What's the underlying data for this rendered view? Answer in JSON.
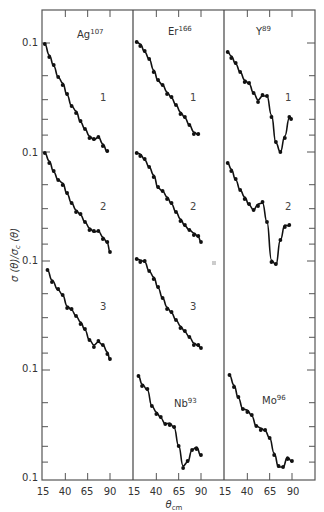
{
  "chart_data": {
    "type": "line",
    "title": "",
    "xlabel": "θ_cm",
    "ylabel": "σ (θ)/σ_c (θ)",
    "x_ticks": [
      15,
      40,
      65,
      90
    ],
    "y_tick_label": "0.1",
    "y_scale": "log",
    "panels": [
      {
        "nucleus": "Ag",
        "mass": "107",
        "curves": [
          {
            "label": "1",
            "x": [
              17,
              22,
              27,
              32,
              37,
              42,
              47,
              52,
              57,
              62,
              67,
              72,
              77,
              82,
              87
            ],
            "y_px": [
              44,
              55,
              66,
              77,
              83,
              95,
              106,
              111,
              122,
              129,
              136,
              140,
              137,
              144,
              152
            ]
          },
          {
            "label": "2",
            "x": [
              17,
              22,
              27,
              32,
              37,
              42,
              47,
              52,
              57,
              62,
              67,
              72,
              77,
              82,
              87,
              90
            ],
            "y_px": [
              153,
              161,
              172,
              180,
              183,
              194,
              203,
              210,
              215,
              222,
              228,
              232,
              231,
              237,
              243,
              252
            ]
          },
          {
            "label": "3",
            "x": [
              20,
              25,
              32,
              37,
              42,
              47,
              52,
              57,
              62,
              67,
              72,
              77,
              82,
              87,
              90
            ],
            "y_px": [
              270,
              280,
              290,
              295,
              306,
              310,
              316,
              322,
              330,
              340,
              345,
              342,
              345,
              352,
              360
            ]
          }
        ]
      },
      {
        "nucleus": "Er",
        "mass": "166",
        "curves": [
          {
            "label": "1",
            "x": [
              18,
              22,
              27,
              32,
              37,
              42,
              47,
              52,
              57,
              62,
              67,
              72,
              77,
              82,
              87
            ],
            "y_px": [
              42,
              44,
              52,
              59,
              70,
              81,
              85,
              92,
              98,
              105,
              112,
              118,
              125,
              132,
              135
            ]
          },
          {
            "label": "2",
            "x": [
              18,
              22,
              27,
              32,
              37,
              42,
              47,
              52,
              57,
              62,
              67,
              72,
              77,
              82,
              87,
              90
            ],
            "y_px": [
              153,
              154,
              160,
              167,
              175,
              188,
              191,
              197,
              204,
              212,
              219,
              226,
              230,
              233,
              237,
              242
            ]
          },
          {
            "label": "3",
            "x": [
              18,
              22,
              27,
              32,
              37,
              42,
              47,
              52,
              57,
              62,
              67,
              72,
              77,
              82,
              87,
              90
            ],
            "y_px": [
              259,
              260,
              262,
              271,
              277,
              288,
              298,
              307,
              313,
              320,
              326,
              332,
              337,
              343,
              346,
              348
            ]
          },
          {
            "label": "Nb93",
            "x": [
              20,
              24,
              30,
              35,
              40,
              45,
              50,
              55,
              60,
              65,
              70,
              75,
              80,
              85,
              90
            ],
            "y_px": [
              376,
              384,
              390,
              406,
              412,
              418,
              424,
              423,
              428,
              446,
              466,
              462,
              450,
              447,
              456
            ]
          }
        ]
      },
      {
        "nucleus": "Y",
        "mass": "89",
        "curves": [
          {
            "label": "1",
            "x": [
              18,
              22,
              27,
              32,
              37,
              42,
              47,
              52,
              57,
              62,
              67,
              72,
              77,
              82,
              87,
              89
            ],
            "y_px": [
              52,
              56,
              64,
              72,
              80,
              84,
              93,
              100,
              96,
              96,
              115,
              143,
              152,
              136,
              118,
              119
            ]
          },
          {
            "label": "2",
            "x": [
              18,
              22,
              27,
              32,
              37,
              42,
              47,
              52,
              57,
              62,
              67,
              72,
              77,
              82,
              87
            ],
            "y_px": [
              163,
              169,
              180,
              190,
              197,
              205,
              210,
              204,
              203,
              222,
              260,
              265,
              240,
              225,
              226
            ]
          },
          {
            "label": "Mo96",
            "x": [
              20,
              25,
              30,
              35,
              40,
              45,
              50,
              55,
              60,
              65,
              70,
              75,
              80,
              85,
              90
            ],
            "y_px": [
              375,
              385,
              398,
              409,
              410,
              416,
              426,
              428,
              431,
              438,
              453,
              467,
              467,
              457,
              462
            ]
          }
        ]
      }
    ]
  },
  "figure": {
    "axis_title_x": "θ",
    "axis_title_x_sub": "cm",
    "axis_title_y": "σ (θ)/σ",
    "axis_title_y_sub": "c",
    "axis_title_y_tail": " (θ)",
    "y_tick_labels": [
      "0.1",
      "0.1",
      "0.1",
      "0.1",
      "0.1"
    ],
    "x_tick_labels": [
      "15",
      "40",
      "65",
      "90"
    ],
    "panel_titles": [
      {
        "base": "Ag",
        "sup": "107"
      },
      {
        "base": "Er",
        "sup": "166"
      },
      {
        "base": "Y",
        "sup": "89"
      }
    ],
    "inner_labels": [
      {
        "base": "Nb",
        "sup": "93"
      },
      {
        "base": "Mo",
        "sup": "96"
      }
    ],
    "curve_numbers": [
      "1",
      "2",
      "3"
    ]
  }
}
